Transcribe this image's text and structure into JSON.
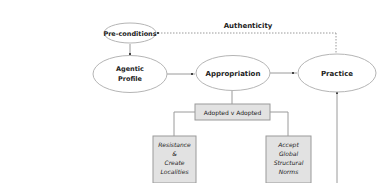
{
  "diagram": {
    "colors": {
      "node_fill": "#ffffff",
      "node_stroke": "#b5b5b5",
      "box_fill": "#e2e2e2",
      "box_stroke": "#9a9a9a",
      "line": "#9a9a9a",
      "text": "#222222"
    },
    "nodes": {
      "preconditions": {
        "label": "Pre-conditions"
      },
      "agentic_profile": {
        "line1": "Agentic",
        "line2": "Profile"
      },
      "appropriation": {
        "label": "Appropriation"
      },
      "practice": {
        "label": "Practice"
      }
    },
    "boxes": {
      "adopted": {
        "label": "Adopted v Adopted"
      },
      "resistance": {
        "line1": "Resistance",
        "line2": "&",
        "line3": "Create",
        "line4": "Localities"
      },
      "accept": {
        "line1": "Accept",
        "line2": "Global",
        "line3": "Structural",
        "line4": "Norms"
      }
    },
    "edges": {
      "authenticity": {
        "label": "Authenticity"
      }
    }
  }
}
